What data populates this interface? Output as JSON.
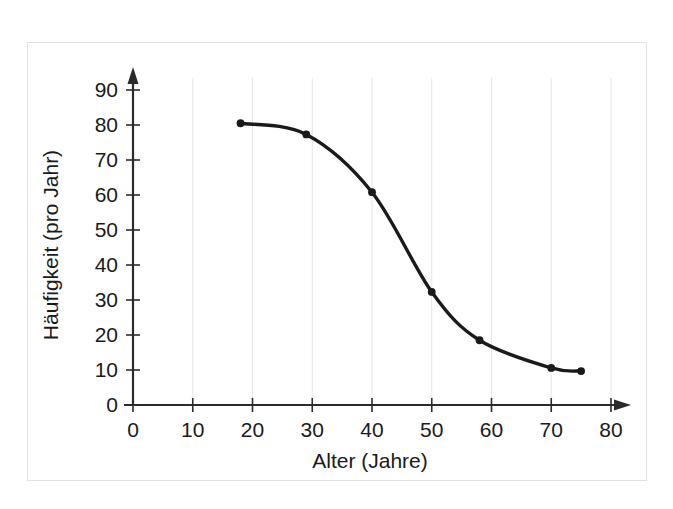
{
  "chart_data": {
    "type": "line",
    "title": "",
    "subtitle": "",
    "xlabel": "Alter (Jahre)",
    "ylabel": "Häufigkeit (pro Jahr)",
    "xlim": [
      0,
      80
    ],
    "ylim": [
      0,
      90
    ],
    "xticks": [
      0,
      10,
      20,
      30,
      40,
      50,
      60,
      70,
      80
    ],
    "yticks": [
      0,
      10,
      20,
      30,
      40,
      50,
      60,
      70,
      80,
      90
    ],
    "xtick_labels": [
      "0",
      "10",
      "20",
      "30",
      "40",
      "50",
      "60",
      "70",
      "80"
    ],
    "ytick_labels": [
      "0",
      "10",
      "20",
      "30",
      "40",
      "50",
      "60",
      "70",
      "80",
      "90"
    ],
    "grid": "vertical-only",
    "legend": "none",
    "series": [
      {
        "name": "Häufigkeit",
        "color": "#1a1a1a",
        "marker": "circle",
        "x": [
          18,
          29,
          40,
          50,
          58,
          70,
          75
        ],
        "y": [
          80.5,
          77.3,
          60.8,
          32.3,
          18.5,
          10.6,
          9.7
        ]
      }
    ],
    "annotations": []
  },
  "style": {
    "axis_color": "#2b2b2b",
    "grid_color": "#e6e6e8",
    "frame_color": "#e2e2e4",
    "background": "#ffffff",
    "line_color": "#1a1a1a",
    "text_color": "#1a1a1a"
  }
}
